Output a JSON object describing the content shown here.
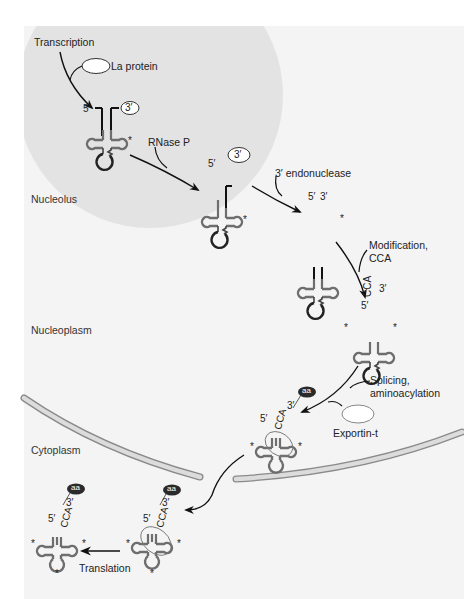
{
  "diagram": {
    "colors": {
      "background_panel": "#f4f4f4",
      "nucleolus": "#e3e3e3",
      "trna_body": "#6e6e6e",
      "trna_loop_dark": "#222222",
      "envelope_fill": "#dcdcdc",
      "envelope_stroke": "#8a8a8a",
      "arrow": "#111111",
      "aa_badge": "#2a2a2a"
    },
    "regions": {
      "nucleolus": "Nucleolus",
      "nucleoplasm": "Nucleoplasm",
      "cytoplasm": "Cytoplasm"
    },
    "steps": [
      {
        "id": "transcription",
        "label": "Transcription"
      },
      {
        "id": "la-protein",
        "label": "La protein"
      },
      {
        "id": "rnase-p",
        "label": "RNase P"
      },
      {
        "id": "endonuclease",
        "label": "3′ endonuclease"
      },
      {
        "id": "modification",
        "label_line1": "Modification,",
        "label_line2": "CCA"
      },
      {
        "id": "splicing",
        "label_line1": "Splicing,",
        "label_line2": "aminoacylation"
      },
      {
        "id": "exportin",
        "label": "Exportin-t"
      },
      {
        "id": "translation",
        "label": "Translation"
      }
    ],
    "end_labels": {
      "five_prime": "5′",
      "three_prime": "3′",
      "cca": "CCA",
      "aa": "aa",
      "modified_mark": "*"
    }
  }
}
